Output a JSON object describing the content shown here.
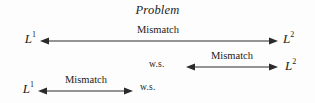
{
  "figure": {
    "title": "Problem",
    "background_color": "#fdfdfd",
    "line_color": "#2a2a2a",
    "text_color": "#1c1c1c"
  },
  "rows": [
    {
      "id": "row-1",
      "left_label": "L",
      "left_sup": "1",
      "left_type": "math",
      "right_label": "L",
      "right_sup": "2",
      "right_type": "math",
      "arrow_label": "Mismatch",
      "arrow_direction": "double"
    },
    {
      "id": "row-2",
      "left_label": "w.s.",
      "left_sup": "",
      "left_type": "text",
      "right_label": "L",
      "right_sup": "2",
      "right_type": "math",
      "arrow_label": "Mismatch",
      "arrow_direction": "double"
    },
    {
      "id": "row-3",
      "left_label": "L",
      "left_sup": "1",
      "left_type": "math",
      "right_label": "w.s.",
      "right_sup": "",
      "right_type": "text",
      "arrow_label": "Mismatch",
      "arrow_direction": "double"
    }
  ]
}
